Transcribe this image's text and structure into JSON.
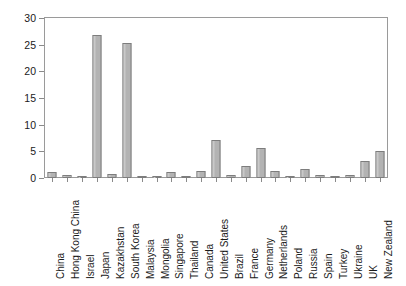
{
  "chart_data": {
    "type": "bar",
    "title": "",
    "subtitle": "",
    "xlabel": "",
    "ylabel": "",
    "ylim": [
      0,
      30
    ],
    "y_ticks": [
      0,
      5,
      10,
      15,
      20,
      25,
      30
    ],
    "grid": false,
    "legend": false,
    "legend_position": "none",
    "bar_color": "#b3b3b3",
    "bar_border_color": "#7d7d7d",
    "axis_color": "#9a9a9a",
    "background": "#ffffff",
    "categories": [
      "China",
      "Hong Kong China",
      "Israel",
      "Japan",
      "Kazakhstan",
      "South Korea",
      "Malaysia",
      "Mongolia",
      "Singapore",
      "Thailand",
      "Canada",
      "United States",
      "Brazil",
      "France",
      "Germany",
      "Netherlands",
      "Poland",
      "Russia",
      "Spain",
      "Turkey",
      "Ukraine",
      "UK",
      "New Zealand"
    ],
    "values": [
      1.1,
      0.5,
      0.4,
      26.8,
      0.8,
      25.4,
      0.05,
      0.4,
      1.2,
      0.05,
      1.4,
      7.1,
      0.5,
      2.2,
      5.6,
      1.4,
      0.4,
      1.7,
      0.5,
      0.1,
      0.6,
      3.2,
      5.0
    ]
  }
}
